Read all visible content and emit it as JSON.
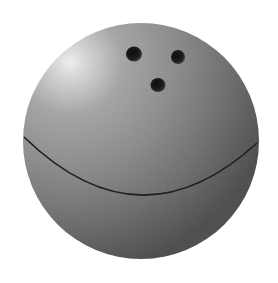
{
  "image": {
    "subject": "bowling ball",
    "background_color": "#ffffff",
    "ball": {
      "center": [
        141,
        141
      ],
      "radius": 118,
      "highlight_color": "#ececec",
      "mid_color": "#8c8c8c",
      "shadow_color": "#4e4e4e",
      "highlight_position": [
        70,
        62
      ]
    },
    "finger_holes": [
      {
        "cx": 134,
        "cy": 54,
        "rx": 8,
        "ry": 7.5
      },
      {
        "cx": 178,
        "cy": 57,
        "rx": 7,
        "ry": 7
      },
      {
        "cx": 158,
        "cy": 85,
        "rx": 7.5,
        "ry": 7
      }
    ],
    "seam_line": {
      "color": "#1e1e1e",
      "path": "M 24 137 Q 140 250 257 143"
    }
  }
}
